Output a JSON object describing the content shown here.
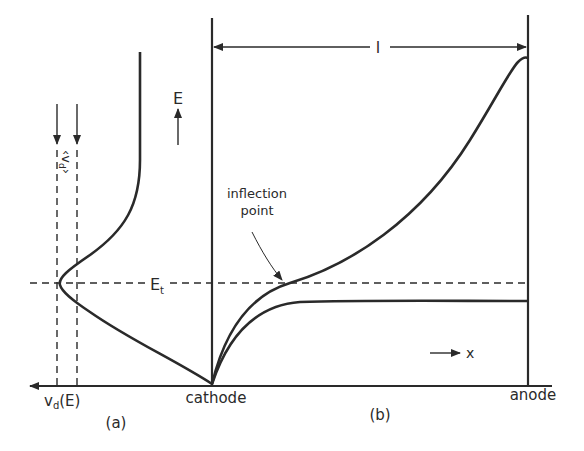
{
  "figure": {
    "panel_a": {
      "label": "(a)",
      "axis_label": "v",
      "axis_label_sub": "d",
      "axis_label_suffix": "(E)",
      "mean_velocity_label": "⟨v_d⟩",
      "mean_velocity_text": "‹v",
      "mean_velocity_sub": "d",
      "mean_velocity_close": "›"
    },
    "panel_b": {
      "label": "(b)",
      "cathode_label": "cathode",
      "anode_label": "anode",
      "length_label": "l",
      "x_direction_label": "x",
      "field_label": "E",
      "annotation": {
        "line1": "inflection",
        "line2": "point"
      }
    },
    "threshold_label": "E",
    "threshold_sub": "t",
    "icons": {
      "field_arrow": "arrow-up-icon",
      "x_arrow": "arrow-right-icon",
      "velocity_axis_arrow": "arrow-left-icon",
      "length_arrows": "double-arrow-icon"
    }
  }
}
